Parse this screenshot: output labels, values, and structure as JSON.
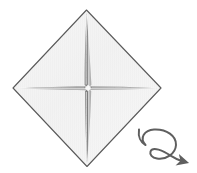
{
  "figure": {
    "kind": "origami-step-diagram",
    "background_color": "#ffffff",
    "canvas": {
      "width": 197,
      "height": 173
    }
  },
  "paper": {
    "name": "square-sheet-rotated-45",
    "shape": "diamond",
    "vertices": {
      "top": {
        "x": 86.5,
        "y": 10
      },
      "right": {
        "x": 161,
        "y": 88
      },
      "bottom": {
        "x": 87,
        "y": 166.5
      },
      "left": {
        "x": 13,
        "y": 88
      }
    },
    "fill_color": "#f4f4f4",
    "fill_color_secondary": "#eeeeee",
    "edge_color": "#5a5a5a",
    "edge_width": 1.1
  },
  "creases": {
    "name": "center-cross-creases",
    "description": "Four tapered crease arms meeting at the center forming a plus sign",
    "center": {
      "x": 88,
      "y": 88
    },
    "color": "#6e6e6e",
    "highlight_color": "#ffffff",
    "arms": [
      {
        "name": "crease-arm-up",
        "to": {
          "x": 86.5,
          "y": 13
        },
        "max_half_width": 2.6
      },
      {
        "name": "crease-arm-right",
        "to": {
          "x": 158,
          "y": 88
        },
        "max_half_width": 2.4
      },
      {
        "name": "crease-arm-down",
        "to": {
          "x": 87,
          "y": 163
        },
        "max_half_width": 2.6
      },
      {
        "name": "crease-arm-left",
        "to": {
          "x": 16,
          "y": 88
        },
        "max_half_width": 2.4
      }
    ],
    "center_gap_radius": 3.2
  },
  "turn_over_symbol": {
    "name": "turn-over-arrow",
    "label": "turn over",
    "color": "#5f5f5f",
    "stroke_width": 2.0,
    "loop_center": {
      "x": 163,
      "y": 146
    },
    "loop_radius_x": 14,
    "loop_radius_y": 15,
    "tail_start": {
      "x": 140,
      "y": 131
    },
    "arrow_tip": {
      "x": 184,
      "y": 160
    }
  }
}
